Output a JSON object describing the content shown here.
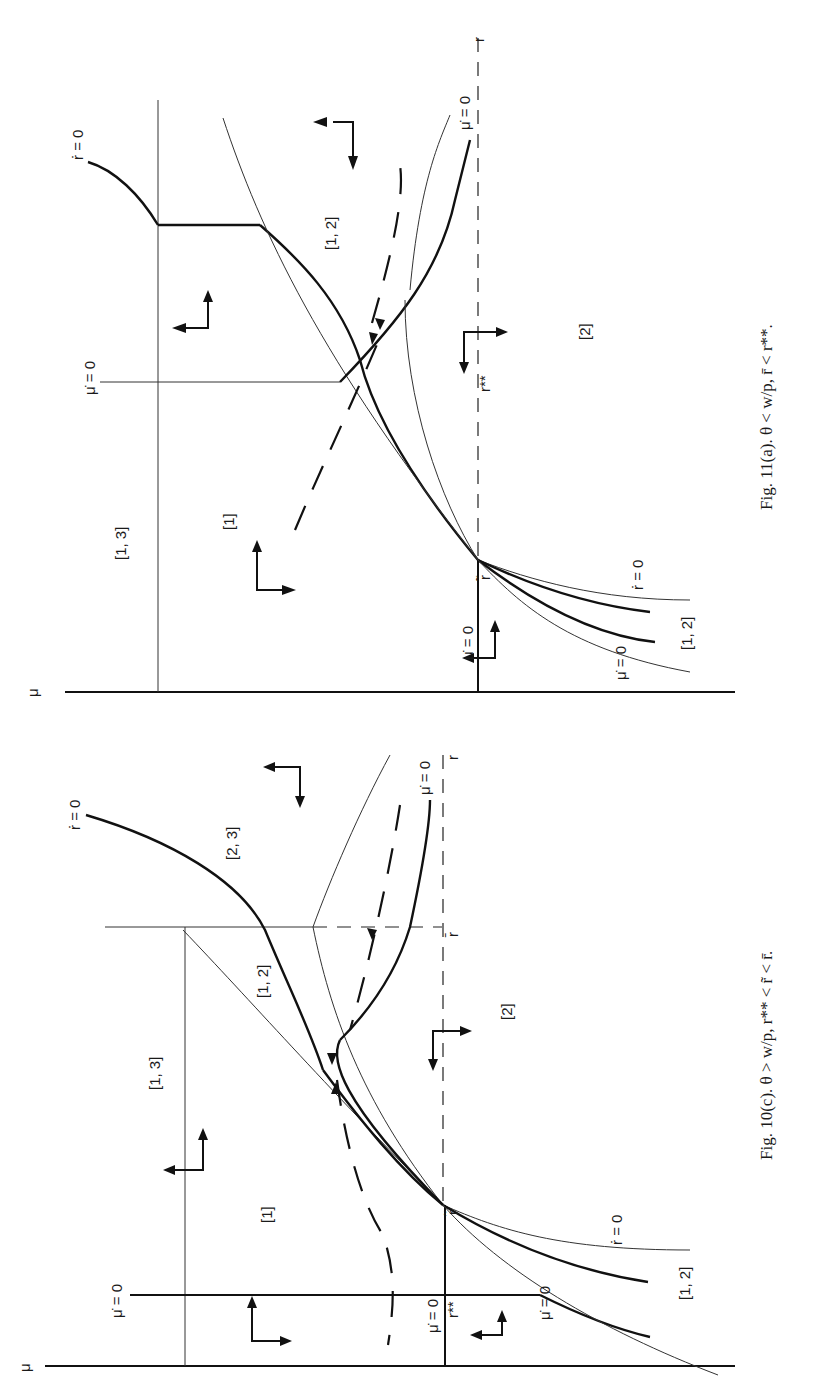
{
  "page": {
    "orientation": "rotated-90-clockwise",
    "background": "#ffffff"
  },
  "figures": [
    {
      "id": "fig-11a",
      "caption": "Fig. 11(a).  θ < w/p, r̄ < r**.",
      "caption_parts": {
        "prefix": "Fig. 11(a).",
        "condition": "θ < w/p, r̄ < r**."
      },
      "axes": {
        "vertical_axis": "μ",
        "horizontal_axis": "r"
      },
      "markers": {
        "r_tilde": "r̃",
        "r_double_star": "r**"
      },
      "curve_labels": {
        "rdot_top": "ṙ = 0",
        "mudot_top": "μ̇ = 0",
        "mudot_right": "μ̇ = 0",
        "mudot_axis": "μ̇ = 0",
        "mudot_lower": "μ̇ = 0",
        "rdot_lower": "ṙ = 0"
      },
      "regions": [
        "[1, 3]",
        "[1]",
        "[1, 2]",
        "[2]",
        "[1, 2]"
      ]
    },
    {
      "id": "fig-10c",
      "caption": "Fig. 10(c).  θ > w/p, r** < r̃ < r̄.",
      "caption_parts": {
        "prefix": "Fig. 10(c).",
        "condition": "θ > w/p, r** < r̃ < r̄."
      },
      "axes": {
        "vertical_axis": "μ",
        "horizontal_axis": "r"
      },
      "markers": {
        "r_tilde": "r̃",
        "r_bar": "r̄",
        "r_double_star": "r**"
      },
      "curve_labels": {
        "rdot_top": "ṙ = 0",
        "mudot_right": "μ̇ = 0",
        "mudot_left": "μ̇ = 0",
        "mudot_axis": "μ̇ = 0",
        "mudot_lower": "μ̇ = 0",
        "rdot_lower": "ṙ = 0"
      },
      "regions": [
        "[2, 3]",
        "[1, 2]",
        "[1, 3]",
        "[1]",
        "[2]",
        "[1, 2]"
      ]
    }
  ]
}
